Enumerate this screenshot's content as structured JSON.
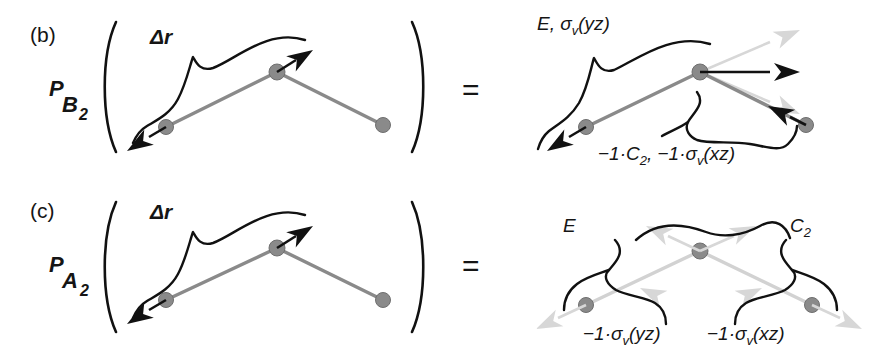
{
  "figure": {
    "background": "#ffffff",
    "colors": {
      "ink": "#151515",
      "atom_gray": "#8a8a8a",
      "ghost_gray": "#d2d2d2",
      "vector_black": "#111111"
    },
    "rows": [
      {
        "id": "row-b",
        "panel_tag": "(b)",
        "operator": "P",
        "operator_subscript": "B",
        "operator_subscript_number": "2",
        "operator_full": "P B2",
        "coordinate_label": "Δr",
        "relation": "=",
        "annotations": [
          {
            "id": "b-top",
            "text": "E, σ",
            "sub": "v",
            "tail": "(yz)",
            "full": "E, σv(yz)"
          },
          {
            "id": "b-bottom",
            "text": "−1·C",
            "sub": "2",
            "tail": ", −1·σ",
            "sub2": "v",
            "tail2": "(xz)",
            "full": "−1·C2, −1·σv(xz)"
          }
        ]
      },
      {
        "id": "row-c",
        "panel_tag": "(c)",
        "operator": "P",
        "operator_subscript": "A",
        "operator_subscript_number": "2",
        "operator_full": "P A2",
        "coordinate_label": "Δr",
        "relation": "=",
        "annotations": [
          {
            "id": "c-E",
            "text": "E",
            "sub": "",
            "tail": "",
            "full": "E"
          },
          {
            "id": "c-C2",
            "text": "C",
            "sub": "2",
            "tail": "",
            "full": "C2"
          },
          {
            "id": "c-syz",
            "text": "−1·σ",
            "sub": "v",
            "tail": "(yz)",
            "full": "−1·σv(yz)"
          },
          {
            "id": "c-sxz",
            "text": "−1·σ",
            "sub": "v",
            "tail": "(xz)",
            "full": "−1·σv(xz)"
          }
        ]
      }
    ]
  }
}
